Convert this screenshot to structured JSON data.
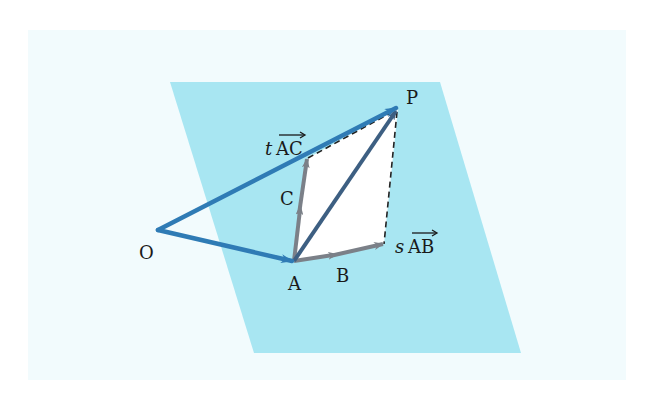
{
  "colors": {
    "page_bg": "#f2fbfd",
    "plane": "#a8e6f2",
    "parallelogram_fill": "#ffffff",
    "vector_OP": "#2f7bb5",
    "vector_OA": "#2f7bb5",
    "vector_AP": "#3d5f82",
    "vector_AB": "#7b8088",
    "vector_AC": "#7b8088",
    "dashed": "#222222"
  },
  "points": {
    "O": {
      "label": "O",
      "x": 158,
      "y": 230
    },
    "A": {
      "label": "A",
      "x": 294,
      "y": 261
    },
    "B": {
      "label": "B",
      "x": 332,
      "y": 256
    },
    "C": {
      "label": "C",
      "x": 299,
      "y": 216
    },
    "P": {
      "label": "P",
      "x": 398,
      "y": 108
    },
    "sAB_end": {
      "x": 384,
      "y": 244
    },
    "tAC_end": {
      "x": 308,
      "y": 158
    }
  },
  "labels": {
    "O": "O",
    "A": "A",
    "B": "B",
    "C": "C",
    "P": "P",
    "sAB_scalar": "s",
    "sAB_vec": "AB",
    "tAC_scalar": "t",
    "tAC_vec": "AC"
  },
  "plane": {
    "corners": [
      [
        170,
        82
      ],
      [
        440,
        82
      ],
      [
        521,
        353
      ],
      [
        254,
        353
      ]
    ]
  }
}
